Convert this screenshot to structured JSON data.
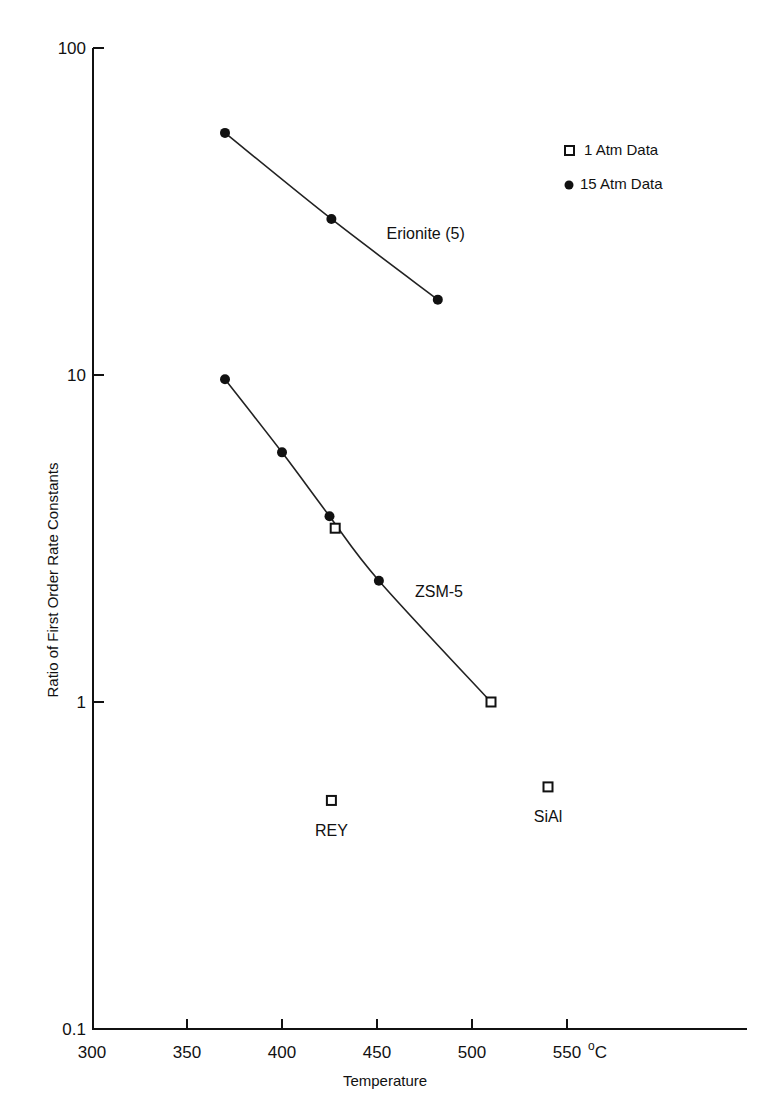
{
  "chart_data": {
    "type": "scatter",
    "title": "",
    "xlabel": "Temperature",
    "x_unit": "°C",
    "ylabel": "Ratio of First Order Rate Constants",
    "yscale": "log",
    "xlim": [
      300,
      640
    ],
    "ylim": [
      0.1,
      100
    ],
    "x_ticks": [
      300,
      350,
      400,
      450,
      500,
      550
    ],
    "x_tick_labels": [
      "300",
      "350",
      "400",
      "450",
      "500",
      "550"
    ],
    "y_ticks": [
      0.1,
      1,
      10,
      100
    ],
    "y_tick_labels": [
      "0.1",
      "1",
      "10",
      "100"
    ],
    "grid": false,
    "legend": {
      "position": "upper right",
      "entries": [
        {
          "marker": "open-square",
          "label": "1 Atm Data"
        },
        {
          "marker": "filled-circle",
          "label": "15 Atm Data"
        }
      ]
    },
    "series": [
      {
        "name": "Erionite (5)",
        "curve": true,
        "points": [
          {
            "x": 370,
            "y": 55,
            "marker": "filled-circle"
          },
          {
            "x": 426,
            "y": 30,
            "marker": "filled-circle"
          },
          {
            "x": 482,
            "y": 17,
            "marker": "filled-circle"
          }
        ]
      },
      {
        "name": "ZSM-5",
        "curve": true,
        "points": [
          {
            "x": 370,
            "y": 9.7,
            "marker": "filled-circle"
          },
          {
            "x": 400,
            "y": 5.8,
            "marker": "filled-circle"
          },
          {
            "x": 425,
            "y": 3.7,
            "marker": "filled-circle"
          },
          {
            "x": 428,
            "y": 3.4,
            "marker": "open-square"
          },
          {
            "x": 451,
            "y": 2.35,
            "marker": "filled-circle"
          },
          {
            "x": 510,
            "y": 1.0,
            "marker": "open-square"
          }
        ]
      },
      {
        "name": "REY",
        "curve": false,
        "points": [
          {
            "x": 426,
            "y": 0.5,
            "marker": "open-square"
          }
        ]
      },
      {
        "name": "SiAl",
        "curve": false,
        "points": [
          {
            "x": 540,
            "y": 0.55,
            "marker": "open-square"
          }
        ]
      }
    ],
    "annotations": [
      {
        "text": "Erionite (5)",
        "x": 455,
        "y": 26
      },
      {
        "text": "ZSM-5",
        "x": 470,
        "y": 2.1
      },
      {
        "text": "REY",
        "x": 426,
        "y": 0.39
      },
      {
        "text": "SiAl",
        "x": 540,
        "y": 0.43
      }
    ]
  },
  "labels": {
    "x_axis_title": "Temperature",
    "x_unit": "°C",
    "y_axis_title": "Ratio of First Order Rate Constants",
    "legend_1atm": "1 Atm Data",
    "legend_15atm": "15 Atm Data",
    "erionite": "Erionite (5)",
    "zsm5": "ZSM-5",
    "rey": "REY",
    "sial": "SiAl"
  },
  "style": {
    "ink": "#111111",
    "background": "#ffffff"
  }
}
